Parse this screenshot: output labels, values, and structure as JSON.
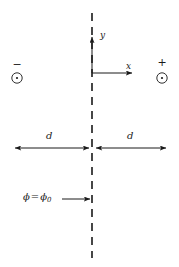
{
  "figure": {
    "background_color": "#ffffff",
    "stroke_color": "#1a1a1a",
    "width": 179,
    "height": 267
  },
  "symmetry_plane": {
    "name": "dashed vertical line",
    "style": "dashed",
    "x": 92,
    "y_top": 13,
    "y_bottom": 258
  },
  "axes": {
    "origin_x": 92,
    "origin_y": 73,
    "y_axis": {
      "label": "y",
      "tip_x": 92,
      "tip_y": 36
    },
    "x_axis": {
      "label": "x",
      "tip_x": 133,
      "tip_y": 73
    }
  },
  "charges": [
    {
      "id": "left",
      "sign_label": "−",
      "symbol": "circle-dot",
      "cx": 17,
      "cy": 78,
      "r": 5
    },
    {
      "id": "right",
      "sign_label": "+",
      "symbol": "circle-dot",
      "cx": 162,
      "cy": 78,
      "r": 5
    }
  ],
  "dimensions": [
    {
      "id": "left-span",
      "label": "d",
      "x_start": 14,
      "x_end": 90,
      "y": 148
    },
    {
      "id": "right-span",
      "label": "d",
      "x_start": 95,
      "x_end": 167,
      "y": 148
    }
  ],
  "potential_annotation": {
    "symbol": "ϕ",
    "equals": "=",
    "subscript": "0",
    "full_text": "ϕ = ϕ0",
    "arrow_x_start": 62,
    "arrow_x_end": 91,
    "arrow_y": 199
  }
}
